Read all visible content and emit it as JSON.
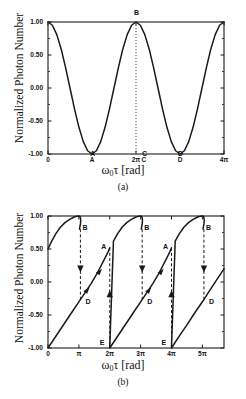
{
  "figures": [
    {
      "id": "a",
      "panel_label": "(a)",
      "ylabel": "Normalized Photon Number",
      "xlabel_main": "ω",
      "xlabel_sub": "0",
      "xlabel_rest": "τ [rad]",
      "xlabel_full": "ω0τ [rad]",
      "yticks": [
        "1.00",
        "0.50",
        "0.00",
        "-0.50",
        "-1.00"
      ],
      "yvalues": [
        1.0,
        0.5,
        0.0,
        -0.5,
        -1.0
      ],
      "xticks": [
        "0",
        "A",
        "2π",
        "C",
        "D",
        "4π"
      ],
      "xtick_positions": [
        0.0,
        1.0,
        2.0,
        2.18,
        3.0,
        4.0
      ],
      "point_labels": [
        {
          "text": "B",
          "x": 2.0,
          "y": 1.0,
          "dx": 0,
          "dy": -9
        },
        {
          "text": "A",
          "x": 1.0,
          "y": -1.0,
          "dx": 0,
          "dy": 0
        },
        {
          "text": "C",
          "x": 2.18,
          "y": -1.0,
          "dx": 0,
          "dy": 0
        },
        {
          "text": "D",
          "x": 3.0,
          "y": -1.0,
          "dx": 0,
          "dy": 0
        }
      ],
      "guide_line": {
        "x": 2.0,
        "style": "dotted",
        "from_y": -1.0,
        "to_y": 1.0
      }
    },
    {
      "id": "b",
      "panel_label": "(b)",
      "ylabel": "Normalized Photon Number",
      "xlabel_main": "ω",
      "xlabel_sub": "0",
      "xlabel_rest": "τ [rad]",
      "xlabel_full": "ω0τ [rad]",
      "yticks": [
        "1.00",
        "0.50",
        "0.00",
        "-0.50",
        "-1.00"
      ],
      "yvalues": [
        1.0,
        0.5,
        0.0,
        -0.5,
        -1.0
      ],
      "xticks": [
        "0",
        "π",
        "2π",
        "3π",
        "4π",
        "5π"
      ],
      "xtick_positions": [
        0.0,
        1.0,
        2.0,
        3.0,
        4.0,
        5.0
      ],
      "point_labels": [
        {
          "text": "B",
          "x": 1.05,
          "y": 0.82,
          "dx": 4,
          "dy": 0
        },
        {
          "text": "B",
          "x": 3.05,
          "y": 0.82,
          "dx": 4,
          "dy": 0
        },
        {
          "text": "B",
          "x": 5.05,
          "y": 0.82,
          "dx": 4,
          "dy": 0
        },
        {
          "text": "A",
          "x": 1.92,
          "y": 0.5,
          "dx": -4,
          "dy": -2
        },
        {
          "text": "A",
          "x": 3.92,
          "y": 0.5,
          "dx": -4,
          "dy": -2
        },
        {
          "text": "D",
          "x": 1.15,
          "y": -0.3,
          "dx": 4,
          "dy": 0
        },
        {
          "text": "D",
          "x": 3.15,
          "y": -0.3,
          "dx": 4,
          "dy": 0
        },
        {
          "text": "D",
          "x": 5.15,
          "y": -0.3,
          "dx": 4,
          "dy": 0
        },
        {
          "text": "E",
          "x": 2.0,
          "y": -0.92,
          "dx": -8,
          "dy": 0
        },
        {
          "text": "E",
          "x": 4.0,
          "y": -0.92,
          "dx": -8,
          "dy": 0
        }
      ],
      "transitions": [
        {
          "kind": "down",
          "x": 1.05,
          "from_y": 0.8,
          "to_y": -0.3
        },
        {
          "kind": "down",
          "x": 3.05,
          "from_y": 0.8,
          "to_y": -0.3
        },
        {
          "kind": "down",
          "x": 5.05,
          "from_y": 0.8,
          "to_y": -0.3
        },
        {
          "kind": "up",
          "x": 2.0,
          "from_y": 0.52,
          "to_y": -0.98
        },
        {
          "kind": "up",
          "x": 4.0,
          "from_y": 0.52,
          "to_y": -0.98
        }
      ]
    }
  ],
  "chart_data": [
    {
      "type": "line",
      "id": "a",
      "title": "",
      "xlabel": "ω0τ [rad]",
      "ylabel": "Normalized Photon Number",
      "xlim": [
        0,
        4
      ],
      "ylim": [
        -1.0,
        1.0
      ],
      "xlim_units": "multiples of π",
      "xticks": [
        0,
        1,
        2,
        3,
        4
      ],
      "xticklabels": [
        "0",
        "A",
        "2π",
        "D",
        "4π"
      ],
      "yticks": [
        -1.0,
        -0.5,
        0.0,
        0.5,
        1.0
      ],
      "yticklabels": [
        "-1.00",
        "-0.50",
        "0.00",
        "0.50",
        "1.00"
      ],
      "grid": false,
      "legend": null,
      "description": "cos(ω0τ) steady-state response: maxima at 0, 2π, 4π; minima at π (A) and 3π (D)",
      "series": [
        {
          "name": "normalized photon number",
          "x": [
            0.0,
            0.1,
            0.2,
            0.3,
            0.4,
            0.5,
            0.6,
            0.7,
            0.8,
            0.9,
            1.0,
            1.1,
            1.2,
            1.3,
            1.4,
            1.5,
            1.6,
            1.7,
            1.8,
            1.9,
            2.0,
            2.1,
            2.2,
            2.3,
            2.4,
            2.5,
            2.6,
            2.7,
            2.8,
            2.9,
            3.0,
            3.1,
            3.2,
            3.3,
            3.4,
            3.5,
            3.6,
            3.7,
            3.8,
            3.9,
            4.0
          ],
          "y": [
            1.0,
            0.951,
            0.809,
            0.588,
            0.309,
            0.0,
            -0.309,
            -0.588,
            -0.809,
            -0.951,
            -1.0,
            -0.951,
            -0.809,
            -0.588,
            -0.309,
            0.0,
            0.309,
            0.588,
            0.809,
            0.951,
            1.0,
            0.951,
            0.809,
            0.588,
            0.309,
            0.0,
            -0.309,
            -0.588,
            -0.809,
            -0.951,
            -1.0,
            -0.951,
            -0.809,
            -0.588,
            -0.309,
            0.0,
            0.309,
            0.588,
            0.809,
            0.951,
            1.0
          ]
        }
      ],
      "annotations": [
        {
          "label": "A",
          "x": 1.0,
          "y": -1.0
        },
        {
          "label": "B",
          "x": 2.0,
          "y": 1.0
        },
        {
          "label": "C",
          "x": 2.18,
          "y": -1.0
        },
        {
          "label": "D",
          "x": 3.0,
          "y": -1.0
        }
      ]
    },
    {
      "type": "line",
      "id": "b",
      "title": "",
      "xlabel": "ω0τ [rad]",
      "ylabel": "Normalized Photon Number",
      "xlim": [
        0,
        5.7
      ],
      "ylim": [
        -1.0,
        1.0
      ],
      "xlim_units": "multiples of π",
      "xticks": [
        0,
        1,
        2,
        3,
        4,
        5
      ],
      "xticklabels": [
        "0",
        "π",
        "2π",
        "3π",
        "4π",
        "5π"
      ],
      "yticks": [
        -1.0,
        -0.5,
        0.0,
        0.5,
        1.0
      ],
      "yticklabels": [
        "-1.00",
        "-0.50",
        "0.00",
        "0.50",
        "1.00"
      ],
      "grid": false,
      "legend": null,
      "description": "Bistable hysteresis response: upper branch rises to B then jumps down to D; lower branch rises to A then jumps up from E",
      "series": [
        {
          "name": "upper-branch-segment-1",
          "x": [
            0.0,
            0.12,
            0.25,
            0.4,
            0.55,
            0.7,
            0.85,
            0.95,
            1.0,
            1.04,
            1.06,
            1.05,
            1.02
          ],
          "y": [
            0.5,
            0.62,
            0.73,
            0.83,
            0.9,
            0.95,
            0.985,
            0.998,
            1.0,
            0.99,
            0.94,
            0.88,
            0.8
          ]
        },
        {
          "name": "lower-branch-segment-1",
          "x": [
            0.0,
            0.2,
            0.4,
            0.6,
            0.8,
            1.0,
            1.2,
            1.4,
            1.6,
            1.8,
            1.95,
            2.0
          ],
          "y": [
            -1.0,
            -0.86,
            -0.72,
            -0.58,
            -0.44,
            -0.3,
            -0.16,
            -0.02,
            0.14,
            0.32,
            0.46,
            0.52
          ]
        },
        {
          "name": "upper-branch-segment-2",
          "x": [
            2.0,
            2.12,
            2.25,
            2.4,
            2.55,
            2.7,
            2.85,
            2.95,
            3.0,
            3.04,
            3.06,
            3.05,
            3.02
          ],
          "y": [
            -0.98,
            0.62,
            0.73,
            0.83,
            0.9,
            0.95,
            0.985,
            0.998,
            1.0,
            0.99,
            0.94,
            0.88,
            0.8
          ]
        },
        {
          "name": "lower-branch-segment-2",
          "x": [
            2.0,
            2.2,
            2.4,
            2.6,
            2.8,
            3.0,
            3.2,
            3.4,
            3.6,
            3.8,
            3.95,
            4.0
          ],
          "y": [
            -1.0,
            -0.86,
            -0.72,
            -0.58,
            -0.44,
            -0.3,
            -0.16,
            -0.02,
            0.14,
            0.32,
            0.46,
            0.52
          ]
        },
        {
          "name": "upper-branch-segment-3",
          "x": [
            4.0,
            4.12,
            4.25,
            4.4,
            4.55,
            4.7,
            4.85,
            4.95,
            5.0,
            5.04,
            5.06,
            5.05,
            5.02
          ],
          "y": [
            -0.98,
            0.62,
            0.73,
            0.83,
            0.9,
            0.95,
            0.985,
            0.998,
            1.0,
            0.99,
            0.94,
            0.88,
            0.8
          ]
        },
        {
          "name": "lower-branch-segment-3",
          "x": [
            4.0,
            4.25,
            4.5,
            4.75,
            5.0,
            5.25,
            5.5,
            5.7
          ],
          "y": [
            -1.0,
            -0.82,
            -0.65,
            -0.47,
            -0.3,
            -0.12,
            0.06,
            0.2
          ]
        }
      ],
      "annotations": [
        {
          "label": "B",
          "x": 1.05,
          "y": 0.82
        },
        {
          "label": "B",
          "x": 3.05,
          "y": 0.82
        },
        {
          "label": "B",
          "x": 5.05,
          "y": 0.82
        },
        {
          "label": "A",
          "x": 1.92,
          "y": 0.5
        },
        {
          "label": "A",
          "x": 3.92,
          "y": 0.5
        },
        {
          "label": "D",
          "x": 1.15,
          "y": -0.3
        },
        {
          "label": "D",
          "x": 3.15,
          "y": -0.3
        },
        {
          "label": "D",
          "x": 5.15,
          "y": -0.3
        },
        {
          "label": "E",
          "x": 2.0,
          "y": -0.92
        },
        {
          "label": "E",
          "x": 4.0,
          "y": -0.92
        }
      ],
      "jump_arrows": [
        {
          "direction": "down",
          "x": 1.05,
          "from_y": 0.8,
          "to_y": -0.3
        },
        {
          "direction": "down",
          "x": 3.05,
          "from_y": 0.8,
          "to_y": -0.3
        },
        {
          "direction": "down",
          "x": 5.05,
          "from_y": 0.8,
          "to_y": -0.3
        },
        {
          "direction": "up",
          "x": 2.0,
          "from_y": 0.52,
          "to_y": -0.98
        },
        {
          "direction": "up",
          "x": 4.0,
          "from_y": 0.52,
          "to_y": -0.98
        }
      ]
    }
  ],
  "colors": {
    "curve": "#1a1a1a",
    "axis": "#1a1a1a",
    "background": "#ffffff",
    "guide": "#555555"
  }
}
